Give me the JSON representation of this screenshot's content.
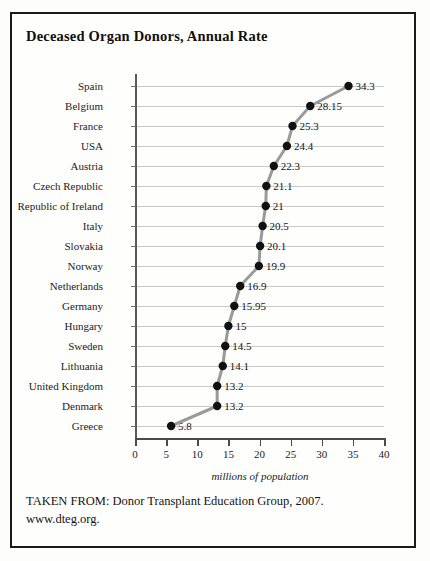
{
  "figure": {
    "title": "Deceased Organ Donors, Annual Rate",
    "source_line_1": "TAKEN FROM: Donor Transplant Education Group, 2007.",
    "source_line_2": "www.dteg.org."
  },
  "chart_data": {
    "type": "line",
    "title": "Deceased Organ Donors, Annual Rate",
    "orientation": "horizontal-categories",
    "xlabel": "millions of population",
    "ylabel": "",
    "xlim": [
      0,
      40
    ],
    "xticks": [
      0,
      5,
      10,
      15,
      20,
      25,
      30,
      35,
      40
    ],
    "xtick_labels": [
      "0",
      "5",
      "10",
      "15",
      "20",
      "25",
      "30",
      "35",
      "40"
    ],
    "grid": "horizontal",
    "legend": "none",
    "categories": [
      "Spain",
      "Belgium",
      "France",
      "USA",
      "Austria",
      "Czech Republic",
      "Republic of Ireland",
      "Italy",
      "Slovakia",
      "Norway",
      "Netherlands",
      "Germany",
      "Hungary",
      "Sweden",
      "Lithuania",
      "United Kingdom",
      "Denmark",
      "Greece"
    ],
    "values": [
      34.3,
      28.15,
      25.3,
      24.4,
      22.3,
      21.1,
      21,
      20.5,
      20.1,
      19.9,
      16.9,
      15.95,
      15,
      14.5,
      14.1,
      13.2,
      13.2,
      5.8
    ],
    "value_labels": [
      "34.3",
      "28.15",
      "25.3",
      "24.4",
      "22.3",
      "21.1",
      "21",
      "20.5",
      "20.1",
      "19.9",
      "16.9",
      "15.95",
      "15",
      "14.5",
      "14.1",
      "13.2",
      "13.2",
      "5.8"
    ],
    "series_color": "#9a9a9a",
    "marker_color": "#111111",
    "grid_color": "#c9c9c9"
  }
}
